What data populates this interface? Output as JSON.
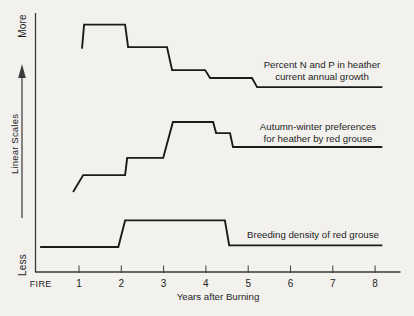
{
  "figure": {
    "bg_color": "#f2f1ee",
    "line_color": "#1b1b1b",
    "axis_color": "#3a3a3a",
    "text_color": "#1d1d1d"
  },
  "chart_data": {
    "type": "line",
    "style": "stepped schematic, no numeric y-axis",
    "title": "",
    "xlabel": "Years after Burning",
    "ylabel": "Linear Scales",
    "legend_position": "labels beside line ends",
    "grid": false,
    "y_axis": {
      "top_label": "More",
      "axis_label": "Linear Scales",
      "bottom_label": "Less",
      "min": 0,
      "max": 10,
      "note": "relative linear scale from Less to More; values below are estimated relative levels"
    },
    "x_axis": {
      "tick_labels": [
        "FIRE",
        "1",
        "2",
        "3",
        "4",
        "5",
        "6",
        "7",
        "8"
      ],
      "tick_values": [
        0,
        1,
        2,
        3,
        4,
        5,
        6,
        7,
        8
      ],
      "tick_marks": [
        1,
        2,
        3,
        4,
        5,
        6,
        7,
        8
      ],
      "range": [
        0,
        8.6
      ]
    },
    "series": [
      {
        "name": "Percent N and P in heather current annual growth",
        "label_lines": [
          "Percent N and P in heather",
          "current annual growth"
        ],
        "points": [
          [
            1.07,
            8.81
          ],
          [
            1.12,
            9.76
          ],
          [
            2.09,
            9.76
          ],
          [
            2.16,
            8.87
          ],
          [
            3.08,
            8.87
          ],
          [
            3.2,
            7.96
          ],
          [
            3.98,
            7.96
          ],
          [
            4.1,
            7.65
          ],
          [
            5.09,
            7.65
          ],
          [
            5.21,
            7.29
          ],
          [
            8.17,
            7.29
          ]
        ]
      },
      {
        "name": "Autumn-winter preferences for heather by red grouse",
        "label_lines": [
          "Autumn-winter preferences",
          "for heather by red grouse"
        ],
        "points": [
          [
            0.86,
            3.14
          ],
          [
            1.1,
            3.81
          ],
          [
            2.09,
            3.81
          ],
          [
            2.14,
            4.49
          ],
          [
            2.99,
            4.49
          ],
          [
            3.22,
            5.91
          ],
          [
            4.17,
            5.91
          ],
          [
            4.24,
            5.47
          ],
          [
            4.57,
            5.47
          ],
          [
            4.64,
            4.92
          ],
          [
            8.17,
            4.92
          ]
        ]
      },
      {
        "name": "Breeding density of red grouse",
        "label_lines": [
          "Breeding density of red grouse"
        ],
        "points": [
          [
            0.08,
            0.97
          ],
          [
            1.93,
            0.97
          ],
          [
            2.09,
            2.02
          ],
          [
            4.45,
            2.02
          ],
          [
            4.55,
            1.03
          ],
          [
            8.17,
            1.03
          ]
        ]
      }
    ]
  }
}
